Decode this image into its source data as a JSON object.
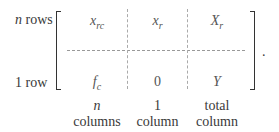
{
  "row_labels": {
    "top": {
      "var": "n",
      "text": " rows"
    },
    "bottom": {
      "text": "1 row"
    }
  },
  "matrix": {
    "top_row": [
      {
        "base": "x",
        "sub": "rc"
      },
      {
        "base": "x",
        "sub": "r"
      },
      {
        "base": "X",
        "sub": "r"
      }
    ],
    "bottom_row": [
      {
        "base": "f",
        "sub": "c"
      },
      {
        "base": "0",
        "sub": ""
      },
      {
        "base": "Y",
        "sub": ""
      }
    ],
    "trailing_punct": "."
  },
  "column_labels": [
    {
      "line1": "n",
      "line2": "columns"
    },
    {
      "line1": "1",
      "line2": "column"
    },
    {
      "line1": "total",
      "line2": "column"
    }
  ]
}
